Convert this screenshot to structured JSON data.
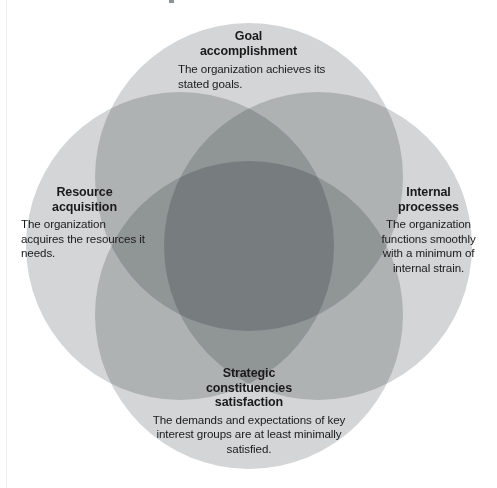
{
  "figure": {
    "kind": "four-circle-venn",
    "background_color": "#ffffff",
    "circle_fill": "#d3d5d6",
    "overlap_two_color": "#a9acac",
    "overlap_three_color": "#858889",
    "overlap_four_color": "#5e6163",
    "text_color": "#1a1a1a"
  },
  "circles": [
    {
      "id": "goal-accomplishment",
      "position": "top",
      "title": "Goal\naccomplishment",
      "title_lines": [
        "Goal",
        "accomplishment"
      ],
      "body": "The organization achieves its stated goals.",
      "cx": 249,
      "cy": 177,
      "r": 154
    },
    {
      "id": "resource-acquisition",
      "position": "left",
      "title": "Resource\nacquisition",
      "title_lines": [
        "Resource",
        "acquisition"
      ],
      "body": "The organization acquires the resources it needs.",
      "cx": 180,
      "cy": 246,
      "r": 154
    },
    {
      "id": "internal-processes",
      "position": "right",
      "title": "Internal\nprocesses",
      "title_lines": [
        "Internal",
        "processes"
      ],
      "body": "The organization functions smoothly with a minimum of internal strain.",
      "cx": 318,
      "cy": 246,
      "r": 154
    },
    {
      "id": "strategic-constituencies-satisfaction",
      "position": "bottom",
      "title": "Strategic\nconstituencies\nsatisfaction",
      "title_lines": [
        "Strategic",
        "constituencies",
        "satisfaction"
      ],
      "body": "The demands and expectations of key interest groups are at least minimally satisfied.",
      "cx": 249,
      "cy": 315,
      "r": 154
    }
  ],
  "labels": {
    "goal": {
      "title_line_1": "Goal",
      "title_line_2": "accomplishment",
      "body": "The organization achieves its stated goals."
    },
    "resource": {
      "title_line_1": "Resource",
      "title_line_2": "acquisition",
      "body": "The organization acquires the resources it needs."
    },
    "internal": {
      "title_line_1": "Internal",
      "title_line_2": "processes",
      "body": "The organization functions smoothly with a minimum of internal strain."
    },
    "strategic": {
      "title_line_1": "Strategic",
      "title_line_2": "constituencies",
      "title_line_3": "satisfaction",
      "body": "The demands and expectations of key interest groups are at least minimally satisfied."
    }
  },
  "chart_data": {
    "type": "venn",
    "title": "",
    "set_count": 4,
    "sets": [
      {
        "name": "Goal accomplishment",
        "description": "The organization achieves its stated goals.",
        "position": "top"
      },
      {
        "name": "Resource acquisition",
        "description": "The organization acquires the resources it needs.",
        "position": "left"
      },
      {
        "name": "Internal processes",
        "description": "The organization functions smoothly with a minimum of internal strain.",
        "position": "right"
      },
      {
        "name": "Strategic constituencies satisfaction",
        "description": "The demands and expectations of key interest groups are at least minimally satisfied.",
        "position": "bottom"
      }
    ],
    "overlap_shading": {
      "one_set": "#d3d5d6",
      "two_sets": "#a9acac",
      "three_sets": "#858889",
      "four_sets": "#5e6163"
    },
    "legend": "none",
    "grid": false
  }
}
